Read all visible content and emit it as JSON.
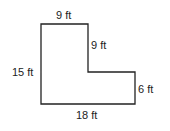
{
  "diagram": {
    "shape": "L-shaped polygon",
    "stroke_color": "#222222",
    "labels": {
      "top": "9 ft",
      "inner_vertical": "9 ft",
      "left": "15 ft",
      "right": "6 ft",
      "bottom": "18 ft"
    }
  }
}
